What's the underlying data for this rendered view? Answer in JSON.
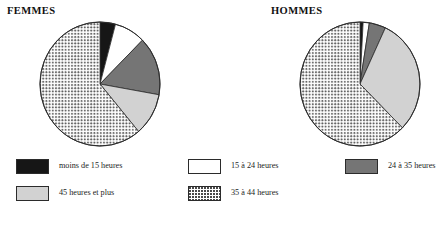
{
  "panels": [
    {
      "id": "femmes",
      "title": "FEMMES"
    },
    {
      "id": "hommes",
      "title": "HOMMES"
    }
  ],
  "legend": {
    "items": [
      {
        "label": "moins de 15 heures",
        "swatch": "black",
        "color": "#161616"
      },
      {
        "label": "15 à 24 heures",
        "swatch": "white",
        "color": "#ffffff"
      },
      {
        "label": "24 à 35 heures",
        "swatch": "dgray",
        "color": "#757575"
      },
      {
        "label": "45 heures et plus",
        "swatch": "lgray",
        "color": "#d2d2d2"
      },
      {
        "label": "35 à 44 heures",
        "swatch": "dotted",
        "color": "#ffffff"
      }
    ]
  },
  "chart_data": [
    {
      "type": "pie",
      "title": "FEMMES",
      "categories": [
        "moins de 15 heures",
        "15 à 24 heures",
        "24 à 35 heures",
        "45 heures et plus",
        "35 à 44 heures"
      ],
      "values": [
        4,
        8,
        15,
        11,
        62
      ],
      "start_angle_deg": 0,
      "direction": "clockwise",
      "slice_boundaries_deg": [
        0,
        15,
        45,
        100,
        140,
        360
      ],
      "colors": [
        "#161616",
        "#ffffff",
        "#757575",
        "#d2d2d2",
        "dotted"
      ],
      "legend_position": "bottom"
    },
    {
      "type": "pie",
      "title": "HOMMES",
      "categories": [
        "moins de 15 heures",
        "15 à 24 heures",
        "24 à 35 heures",
        "45 heures et plus",
        "35 à 44 heures"
      ],
      "values": [
        1,
        2,
        4,
        31,
        62
      ],
      "start_angle_deg": 0,
      "direction": "clockwise",
      "slice_boundaries_deg": [
        0,
        3,
        9,
        25,
        135,
        360
      ],
      "colors": [
        "#161616",
        "#ffffff",
        "#757575",
        "#d2d2d2",
        "dotted"
      ],
      "legend_position": "bottom"
    }
  ]
}
